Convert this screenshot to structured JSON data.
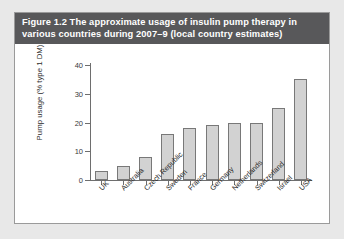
{
  "figure": {
    "caption_line1": "Figure 1.2  The approximate usage of insulin pump therapy in",
    "caption_line2": "various countries during 2007–9 (local country estimates)",
    "caption_bg": "#58585a",
    "caption_color": "#ffffff",
    "border_color": "#9a9a9a",
    "background": "#ffffff"
  },
  "chart_data": {
    "type": "bar",
    "title": "Figure 1.2  The approximate usage of insulin pump therapy in various countries during 2007–9 (local country estimates)",
    "xlabel": "",
    "ylabel": "Pump usage (% type 1 DM)",
    "categories": [
      "UK",
      "Australia",
      "Czech Republic",
      "Sweden",
      "France",
      "Germany",
      "Netherlands",
      "Switzerland",
      "Israel",
      "USA"
    ],
    "values": [
      3,
      5,
      8,
      16,
      18,
      19,
      20,
      20,
      25,
      35
    ],
    "ylim": [
      0,
      40
    ],
    "yticks": [
      0,
      10,
      20,
      30,
      40
    ],
    "ytick_labels": [
      "0",
      "10",
      "20",
      "30",
      "40"
    ],
    "grid": false,
    "legend": false,
    "bar_color": "#d2d2d2",
    "bar_border_color": "#787878",
    "axis_color": "#6e6e6e"
  }
}
